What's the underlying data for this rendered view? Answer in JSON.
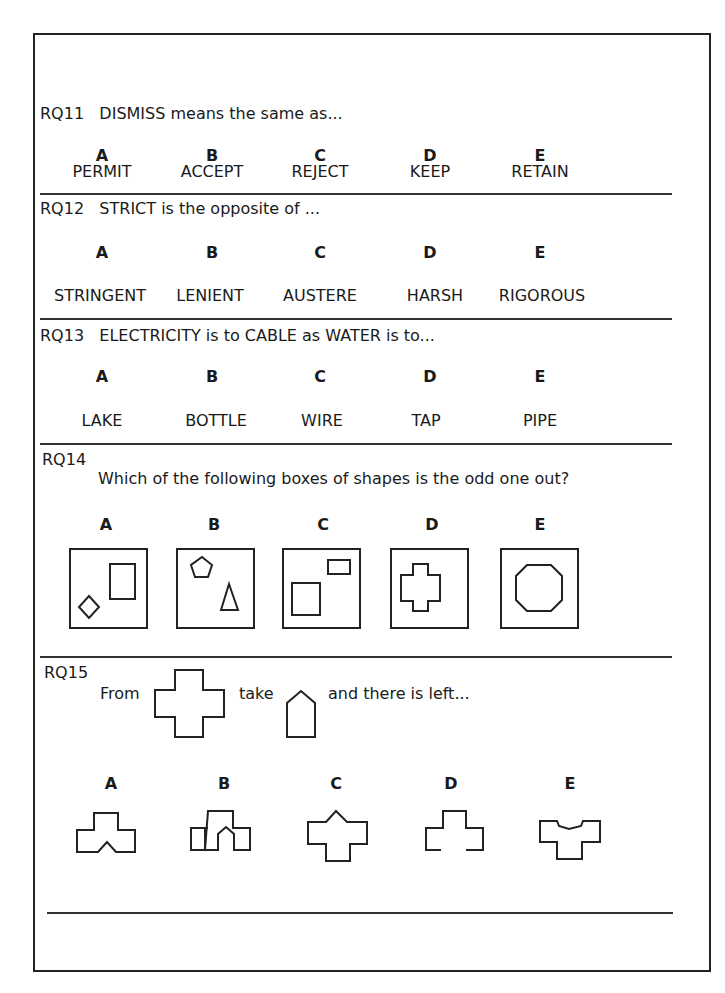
{
  "questions": [
    {
      "id": "RQ11",
      "prompt": "DISMISS means the same as...",
      "letters": [
        "A",
        "B",
        "C",
        "D",
        "E"
      ],
      "options": [
        "PERMIT",
        "ACCEPT",
        "REJECT",
        "KEEP",
        "RETAIN"
      ]
    },
    {
      "id": "RQ12",
      "prompt": "STRICT is the opposite of ...",
      "letters": [
        "A",
        "B",
        "C",
        "D",
        "E"
      ],
      "options": [
        "STRINGENT",
        "LENIENT",
        "AUSTERE",
        "HARSH",
        "RIGOROUS"
      ]
    },
    {
      "id": "RQ13",
      "prompt": "ELECTRICITY is to CABLE as WATER is to...",
      "letters": [
        "A",
        "B",
        "C",
        "D",
        "E"
      ],
      "options": [
        "LAKE",
        "BOTTLE",
        "WIRE",
        "TAP",
        "PIPE"
      ]
    },
    {
      "id": "RQ14",
      "prompt": "Which of the following boxes of shapes is the odd one out?",
      "letters": [
        "A",
        "B",
        "C",
        "D",
        "E"
      ],
      "options": [
        "diamond and rectangle",
        "pentagon and triangle",
        "two rectangles",
        "cross",
        "octagon"
      ]
    },
    {
      "id": "RQ15",
      "prompt_from": "From",
      "prompt_take": "take",
      "prompt_rest": "and there is left...",
      "from_shape": "cross",
      "take_shape": "house-pentagon",
      "letters": [
        "A",
        "B",
        "C",
        "D",
        "E"
      ],
      "options": [
        "T-shape with notch at bottom",
        "T-shape with arch cut-out",
        "cross with peak on top",
        "T-shape open at bottom",
        "T-shape with V-dip on top"
      ]
    }
  ]
}
